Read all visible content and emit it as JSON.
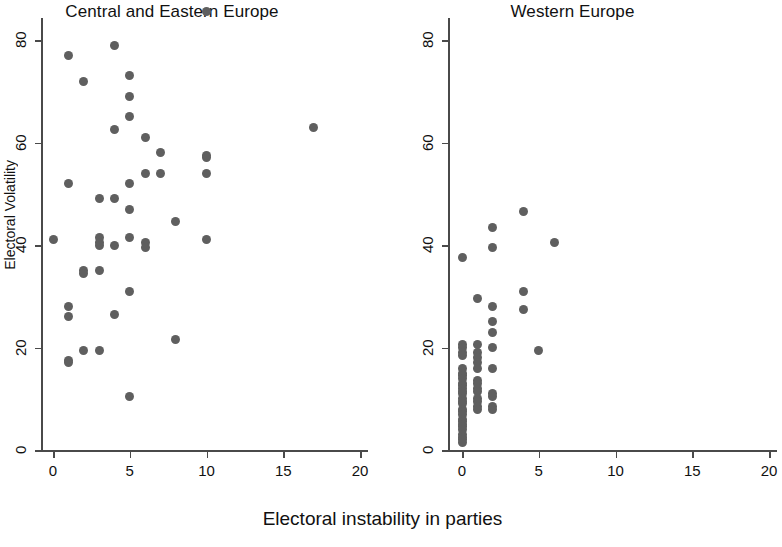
{
  "chart_data": {
    "type": "scatter",
    "title": "",
    "xlabel": "Electoral instability in parties",
    "ylabel": "Electoral Volatility",
    "xlim": [
      0,
      20
    ],
    "ylim": [
      0,
      80
    ],
    "xticks": [
      0,
      5,
      10,
      15,
      20
    ],
    "yticks": [
      0,
      20,
      40,
      60,
      80
    ],
    "xtick_labels": [
      "0",
      "5",
      "10",
      "15",
      "20"
    ],
    "ytick_labels": [
      "0",
      "20",
      "40",
      "60",
      "80"
    ],
    "grid": false,
    "legend": "none",
    "marker_color": "#5f5f5f",
    "axis_color": "#4a4a4a",
    "panels": [
      {
        "title": "Central and Eastern Europe",
        "series_name": "Central and Eastern Europe",
        "points": [
          [
            0,
            41
          ],
          [
            1,
            77
          ],
          [
            1,
            52
          ],
          [
            1,
            28
          ],
          [
            1,
            26
          ],
          [
            1,
            17.5
          ],
          [
            1,
            17
          ],
          [
            2,
            72
          ],
          [
            2,
            35
          ],
          [
            2,
            34.5
          ],
          [
            2,
            19.5
          ],
          [
            3,
            49
          ],
          [
            3,
            41.5
          ],
          [
            3,
            40.5
          ],
          [
            3,
            40
          ],
          [
            3,
            35
          ],
          [
            3,
            19.5
          ],
          [
            4,
            79
          ],
          [
            4,
            62.5
          ],
          [
            4,
            49
          ],
          [
            4,
            40
          ],
          [
            4,
            26.5
          ],
          [
            5,
            73
          ],
          [
            5,
            69
          ],
          [
            5,
            65
          ],
          [
            5,
            52
          ],
          [
            5,
            47
          ],
          [
            5,
            41.5
          ],
          [
            5,
            31
          ],
          [
            5,
            10.5
          ],
          [
            6,
            61
          ],
          [
            6,
            54
          ],
          [
            6,
            40.5
          ],
          [
            6,
            39.5
          ],
          [
            7,
            58
          ],
          [
            7,
            54
          ],
          [
            8,
            44.5
          ],
          [
            8,
            21.5
          ],
          [
            10,
            85.5
          ],
          [
            10,
            57
          ],
          [
            10,
            57.5
          ],
          [
            10,
            54
          ],
          [
            10,
            41
          ],
          [
            17,
            63
          ]
        ]
      },
      {
        "title": "Western Europe",
        "series_name": "Western Europe",
        "points": [
          [
            0,
            37.5
          ],
          [
            0,
            20.5
          ],
          [
            0,
            20
          ],
          [
            0,
            19
          ],
          [
            0,
            18.5
          ],
          [
            0,
            16
          ],
          [
            0,
            15
          ],
          [
            0,
            14.5
          ],
          [
            0,
            14
          ],
          [
            0,
            13
          ],
          [
            0,
            12.5
          ],
          [
            0,
            12
          ],
          [
            0,
            11.5
          ],
          [
            0,
            11
          ],
          [
            0,
            10
          ],
          [
            0,
            9.5
          ],
          [
            0,
            9
          ],
          [
            0,
            8
          ],
          [
            0,
            7.5
          ],
          [
            0,
            7
          ],
          [
            0,
            6
          ],
          [
            0,
            5.5
          ],
          [
            0,
            5
          ],
          [
            0,
            4.5
          ],
          [
            0,
            4
          ],
          [
            0,
            3
          ],
          [
            0,
            2.5
          ],
          [
            0,
            2
          ],
          [
            0,
            1.5
          ],
          [
            1,
            29.5
          ],
          [
            1,
            20.5
          ],
          [
            1,
            19
          ],
          [
            1,
            18
          ],
          [
            1,
            17
          ],
          [
            1,
            16
          ],
          [
            1,
            13.5
          ],
          [
            1,
            13
          ],
          [
            1,
            12
          ],
          [
            1,
            11.5
          ],
          [
            1,
            10
          ],
          [
            1,
            9.5
          ],
          [
            1,
            8.5
          ],
          [
            1,
            8
          ],
          [
            2,
            43.5
          ],
          [
            2,
            39.5
          ],
          [
            2,
            28
          ],
          [
            2,
            25
          ],
          [
            2,
            23
          ],
          [
            2,
            20
          ],
          [
            2,
            16
          ],
          [
            2,
            11
          ],
          [
            2,
            10.5
          ],
          [
            2,
            8.5
          ],
          [
            2,
            8
          ],
          [
            4,
            46.5
          ],
          [
            4,
            31
          ],
          [
            4,
            27.5
          ],
          [
            5,
            19.5
          ],
          [
            6,
            40.5
          ]
        ]
      }
    ]
  }
}
